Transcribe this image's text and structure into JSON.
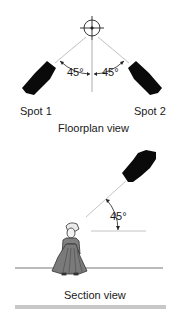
{
  "floorplan": {
    "title": "Floorplan view",
    "spots": [
      {
        "label": "Spot 1",
        "angle": "45°"
      },
      {
        "label": "Spot 2",
        "angle": "45°"
      }
    ],
    "target_icon": "crosshair-icon"
  },
  "section": {
    "title": "Section view",
    "angle": "45°",
    "figure_icon": "person-icon",
    "spot_icon": "spotlight-icon"
  },
  "colors": {
    "ink": "#111111",
    "lines": "#9a9a9a",
    "figure": "#7a7a7a",
    "bar": "#c8c8c8"
  }
}
